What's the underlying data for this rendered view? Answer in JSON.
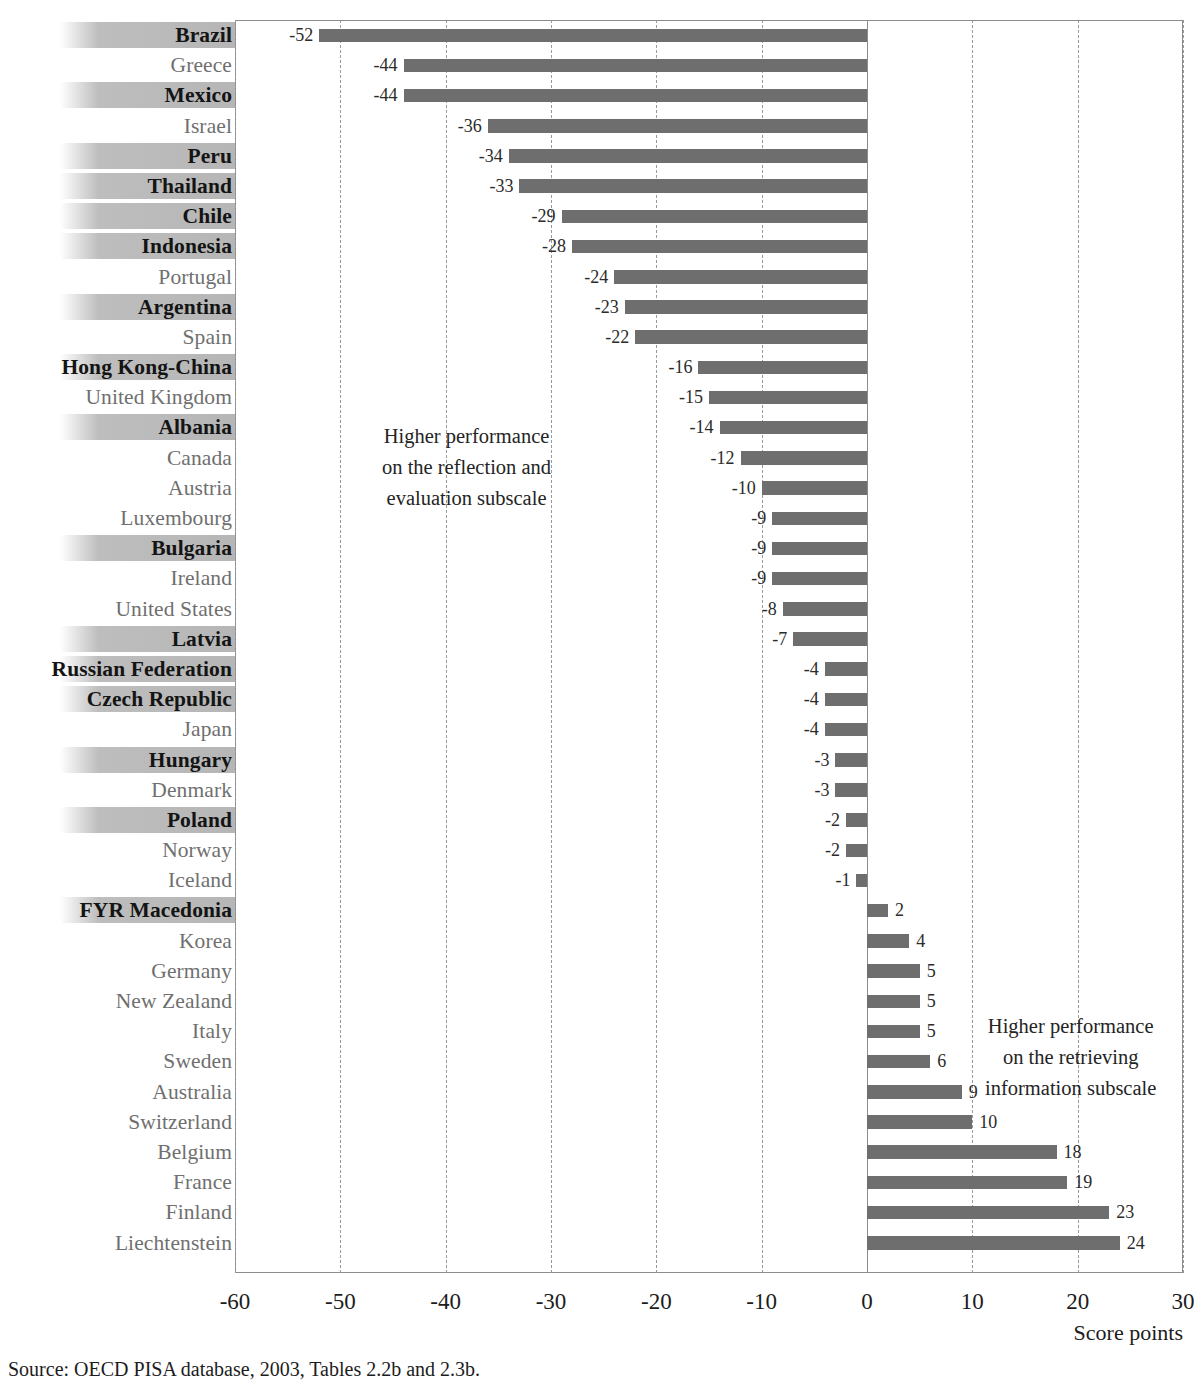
{
  "chart_data": {
    "type": "bar",
    "orientation": "horizontal",
    "title": "",
    "xlabel": "Score points",
    "ylabel": "",
    "xlim": [
      -60,
      30
    ],
    "xticks": [
      "-60",
      "-50",
      "-40",
      "-30",
      "-20",
      "-10",
      "0",
      "10",
      "20",
      "30"
    ],
    "xtick_values": [
      -60,
      -50,
      -40,
      -30,
      -20,
      -10,
      0,
      10,
      20,
      30
    ],
    "grid": "vertical dashed gridlines at each 10-point tick",
    "legend": "none",
    "bar_color": "#6e6e6e",
    "categories": [
      "Brazil",
      "Greece",
      "Mexico",
      "Israel",
      "Peru",
      "Thailand",
      "Chile",
      "Indonesia",
      "Portugal",
      "Argentina",
      "Spain",
      "Hong Kong-China",
      "United Kingdom",
      "Albania",
      "Canada",
      "Austria",
      "Luxembourg",
      "Bulgaria",
      "Ireland",
      "United States",
      "Latvia",
      "Russian Federation",
      "Czech Republic",
      "Japan",
      "Hungary",
      "Denmark",
      "Poland",
      "Norway",
      "Iceland",
      "FYR Macedonia",
      "Korea",
      "Germany",
      "New Zealand",
      "Italy",
      "Sweden",
      "Australia",
      "Switzerland",
      "Belgium",
      "France",
      "Finland",
      "Liechtenstein"
    ],
    "values": [
      -52,
      -44,
      -44,
      -36,
      -34,
      -33,
      -29,
      -28,
      -24,
      -23,
      -22,
      -16,
      -15,
      -14,
      -12,
      -10,
      -9,
      -9,
      -9,
      -8,
      -7,
      -4,
      -4,
      -4,
      -3,
      -3,
      -2,
      -2,
      -1,
      2,
      4,
      5,
      5,
      5,
      6,
      9,
      10,
      18,
      19,
      23,
      24
    ],
    "value_labels": [
      "-52",
      "-44",
      "-44",
      "-36",
      "-34",
      "-33",
      "-29",
      "-28",
      "-24",
      "-23",
      "-22",
      "-16",
      "-15",
      "-14",
      "-12",
      "-10",
      "-9",
      "-9",
      "-9",
      "-8",
      "-7",
      "-4",
      "-4",
      "-4",
      "-3",
      "-3",
      "-2",
      "-2",
      "-1",
      "2",
      "4",
      "5",
      "5",
      "5",
      "6",
      "9",
      "10",
      "18",
      "19",
      "23",
      "24"
    ],
    "highlighted": [
      "Brazil",
      "Mexico",
      "Peru",
      "Thailand",
      "Chile",
      "Indonesia",
      "Argentina",
      "Hong Kong-China",
      "Albania",
      "Bulgaria",
      "Latvia",
      "Russian Federation",
      "Czech Republic",
      "Hungary",
      "Poland",
      "FYR Macedonia"
    ],
    "annotations": [
      {
        "id": "left",
        "lines": [
          "Higher performance",
          "on the reflection and",
          "evaluation subscale"
        ]
      },
      {
        "id": "right",
        "lines": [
          "Higher performance",
          "on the retrieving",
          "information subscale"
        ]
      }
    ]
  },
  "annotation_left": {
    "line1": "Higher performance",
    "line2": "on the reflection and",
    "line3": "evaluation subscale"
  },
  "annotation_right": {
    "line1": "Higher performance",
    "line2": "on the retrieving",
    "line3": "information subscale"
  },
  "axis": {
    "title": "Score points"
  },
  "source": {
    "label": "Source:",
    "text": "OECD PISA database, 2003, Tables 2.2b and 2.3b."
  }
}
